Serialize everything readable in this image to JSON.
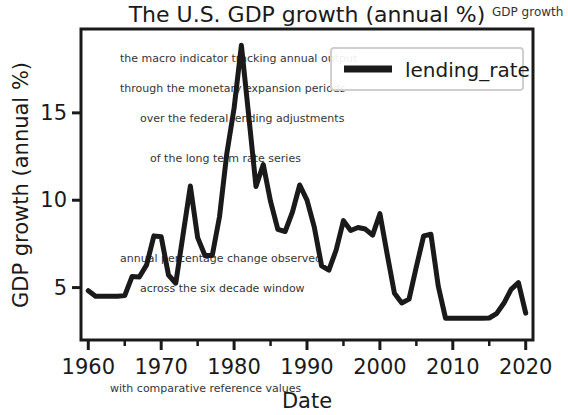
{
  "chart_data": {
    "type": "line",
    "title": "The U.S. GDP growth (annual %)",
    "xlabel": "Date",
    "ylabel": "GDP growth (annual %)",
    "xlim": [
      1959,
      2021
    ],
    "ylim": [
      2.0,
      19.8
    ],
    "grid": false,
    "legend_position": "upper right",
    "x_ticks": [
      "1960",
      "1970",
      "1980",
      "1990",
      "2000",
      "2010",
      "2020"
    ],
    "x_tick_values": [
      1960,
      1970,
      1980,
      1990,
      2000,
      2010,
      2020
    ],
    "x_minor_tick_values": [
      1965,
      1975,
      1985,
      1995,
      2005,
      2015
    ],
    "y_ticks": [
      "5",
      "10",
      "15"
    ],
    "y_tick_values": [
      5,
      10,
      15
    ],
    "line_color": "#1a1a1a",
    "line_width": 5,
    "series": [
      {
        "name": "lending_rate",
        "x": [
          1960,
          1961,
          1962,
          1963,
          1964,
          1965,
          1966,
          1967,
          1968,
          1969,
          1970,
          1971,
          1972,
          1973,
          1974,
          1975,
          1976,
          1977,
          1978,
          1979,
          1980,
          1981,
          1982,
          1983,
          1984,
          1985,
          1986,
          1987,
          1988,
          1989,
          1990,
          1991,
          1992,
          1993,
          1994,
          1995,
          1996,
          1997,
          1998,
          1999,
          2000,
          2001,
          2002,
          2003,
          2004,
          2005,
          2006,
          2007,
          2008,
          2009,
          2010,
          2011,
          2012,
          2013,
          2014,
          2015,
          2016,
          2017,
          2018,
          2019,
          2020
        ],
        "values": [
          4.82,
          4.5,
          4.5,
          4.5,
          4.5,
          4.54,
          5.63,
          5.61,
          6.3,
          7.96,
          7.91,
          5.72,
          5.25,
          8.03,
          10.81,
          7.86,
          6.84,
          6.83,
          9.06,
          12.67,
          15.27,
          18.87,
          14.86,
          10.79,
          12.04,
          9.93,
          8.33,
          8.21,
          9.32,
          10.87,
          10.01,
          8.46,
          6.25,
          6.0,
          7.15,
          8.83,
          8.27,
          8.44,
          8.35,
          8.0,
          9.23,
          6.91,
          4.67,
          4.12,
          4.34,
          6.19,
          7.96,
          8.05,
          5.09,
          3.25,
          3.25,
          3.25,
          3.25,
          3.25,
          3.25,
          3.26,
          3.51,
          4.1,
          4.9,
          5.28,
          3.54
        ]
      }
    ]
  },
  "legend": {
    "entries": [
      {
        "label": "lending_rate",
        "color": "#1a1a1a"
      }
    ]
  },
  "background_text": {
    "lines": [
      "GDP growth was",
      "the macro indicator tracking annual output",
      "through the monetary expansion periods",
      "over the federal lending adjustments",
      "of the long term rate series"
    ]
  }
}
